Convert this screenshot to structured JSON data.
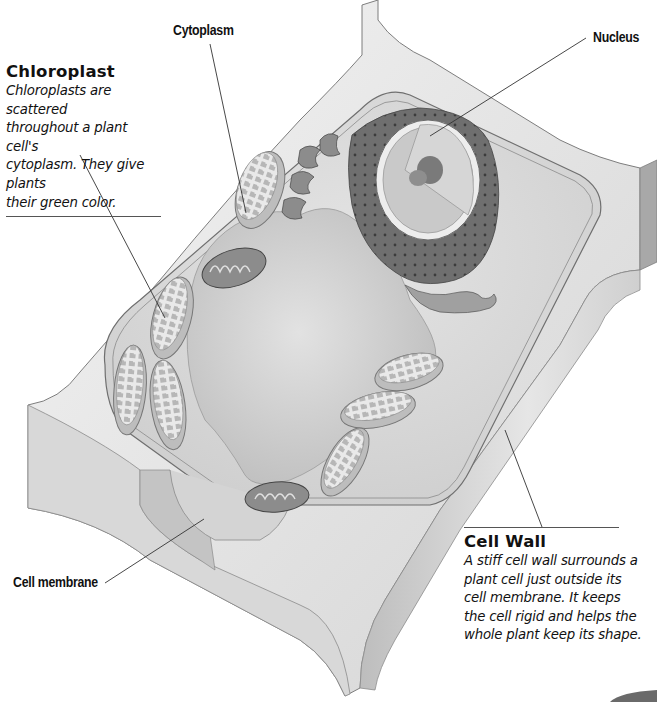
{
  "diagram": {
    "subject": "Plant cell",
    "style": "grayscale 3D cutaway illustration"
  },
  "labels": {
    "cytoplasm": "Cytoplasm",
    "nucleus": "Nucleus",
    "cell_membrane": "Cell membrane"
  },
  "callouts": {
    "chloroplast": {
      "title": "Chloroplast",
      "lines": [
        "Chloroplasts are scattered",
        "throughout a plant cell's",
        "cytoplasm. They give plants",
        "their green color."
      ]
    },
    "cell_wall": {
      "title": "Cell Wall",
      "lines": [
        "A stiff cell wall surrounds a",
        "plant cell just outside its",
        "cell membrane.  It keeps",
        "the cell rigid and helps the",
        "whole plant keep its shape."
      ]
    }
  },
  "colors": {
    "wall_light": "#ececec",
    "wall_mid": "#d2d2d2",
    "wall_dark": "#a9a9a9",
    "cytoplasm": "#dcdcdc",
    "vacuole": "#c9c9c9",
    "er_dark": "#6e6e6e",
    "nucleus": "#bdbdbd",
    "nucleolus": "#7a7a7a",
    "text": "#111111"
  }
}
